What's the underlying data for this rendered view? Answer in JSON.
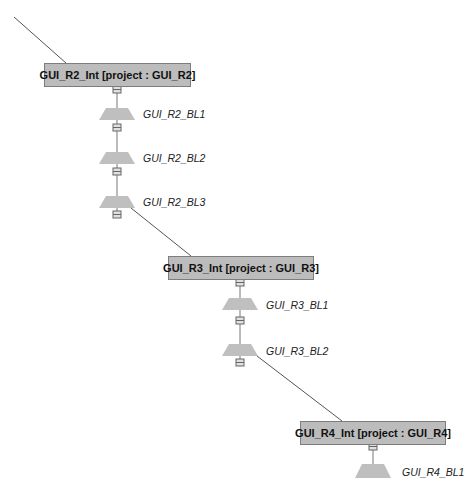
{
  "diagram": {
    "colors": {
      "box_fill": "#bcbcbc",
      "box_border": "#7d7d7d",
      "trapezoid_fill": "#bfbfbf",
      "line": "#555555",
      "connector_fill": "#e0e0e0"
    },
    "groups": [
      {
        "id": "R2",
        "box_label": "GUI_R2_Int [project : GUI_R2]",
        "baselines": [
          "GUI_R2_BL1",
          "GUI_R2_BL2",
          "GUI_R2_BL3"
        ]
      },
      {
        "id": "R3",
        "box_label": "GUI_R3_Int [project : GUI_R3]",
        "baselines": [
          "GUI_R3_BL1",
          "GUI_R3_BL2"
        ]
      },
      {
        "id": "R4",
        "box_label": "GUI_R4_Int [project : GUI_R4]",
        "baselines": [
          "GUI_R4_BL1"
        ]
      }
    ]
  }
}
